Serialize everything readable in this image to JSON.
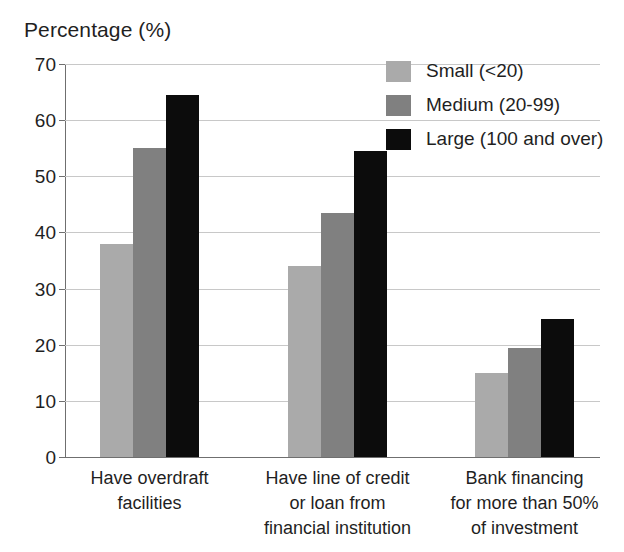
{
  "chart_data": {
    "type": "bar",
    "title": "Percentage (%)",
    "xlabel": "",
    "ylabel": "Percentage (%)",
    "ylim": [
      0,
      70
    ],
    "ytick_step": 10,
    "yticks": [
      70,
      60,
      50,
      40,
      30,
      20,
      10,
      0
    ],
    "grid": true,
    "legend_position": "top-right",
    "categories": [
      "Have overdraft facilities",
      "Have line of credit or loan from financial institution",
      "Bank financing for more than 50% of investment"
    ],
    "category_lines": [
      [
        "Have overdraft",
        "facilities"
      ],
      [
        "Have line of credit",
        "or loan from",
        "financial institution"
      ],
      [
        "Bank financing",
        "for more than 50%",
        "of investment"
      ]
    ],
    "series": [
      {
        "name": "Small (<20)",
        "color": "#aaaaaa",
        "values": [
          38.0,
          34.0,
          15.0
        ]
      },
      {
        "name": "Medium (20-99)",
        "color": "#808080",
        "values": [
          55.0,
          43.5,
          19.5
        ]
      },
      {
        "name": "Large (100 and over)",
        "color": "#0c0c0c",
        "values": [
          64.5,
          54.5,
          24.5
        ]
      }
    ]
  },
  "legend": {
    "items": [
      {
        "label": "Small (<20)",
        "color": "#aaaaaa"
      },
      {
        "label": "Medium (20-99)",
        "color": "#808080"
      },
      {
        "label": "Large (100 and over)",
        "color": "#0c0c0c"
      }
    ]
  },
  "axis": {
    "title": "Percentage (%)",
    "ytick_labels": [
      "70",
      "60",
      "50",
      "40",
      "30",
      "20",
      "10",
      "0"
    ]
  }
}
